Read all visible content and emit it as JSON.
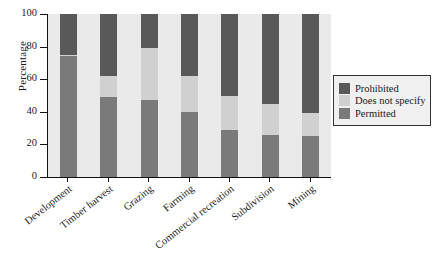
{
  "chart_data": {
    "type": "bar",
    "stacked": true,
    "title": "",
    "xlabel": "",
    "ylabel": "Percentage",
    "ylim": [
      0,
      100
    ],
    "yticks": [
      0,
      20,
      40,
      60,
      80,
      100
    ],
    "grid": false,
    "legend_position": "right",
    "categories": [
      "Development",
      "Timber harvest",
      "Grazing",
      "Farming",
      "Commercial recreation",
      "Subdivision",
      "Mining"
    ],
    "series": [
      {
        "name": "Prohibited",
        "color": "#595959",
        "values": [
          25,
          38,
          21,
          38,
          50,
          55,
          61
        ]
      },
      {
        "name": "Does not specify",
        "color": "#d0d0d0",
        "values": [
          1,
          13,
          32,
          22,
          21,
          19,
          14
        ]
      },
      {
        "name": "Permitted",
        "color": "#7a7a7a",
        "values": [
          74,
          49,
          47,
          40,
          29,
          26,
          25
        ]
      }
    ],
    "cumulative_tops": {
      "note": "stack boundaries read from axis",
      "prohibited_bottom_edge": [
        75,
        62,
        79,
        62,
        50,
        45,
        39
      ],
      "permitted_top_edge": [
        74,
        49,
        47,
        40,
        29,
        26,
        25
      ]
    }
  },
  "legend": {
    "items": [
      {
        "label": "Prohibited",
        "color": "#595959"
      },
      {
        "label": "Does not specify",
        "color": "#d0d0d0"
      },
      {
        "label": "Permitted",
        "color": "#7a7a7a"
      }
    ]
  },
  "axis": {
    "y_title": "Percentage",
    "y_tick_labels": [
      "100",
      "80",
      "60",
      "40",
      "20",
      "0"
    ]
  },
  "colors": {
    "plot_background": "#eaeaea",
    "axis_line": "#111111",
    "prohibited": "#595959",
    "does_not_specify": "#d0d0d0",
    "permitted": "#7a7a7a"
  }
}
